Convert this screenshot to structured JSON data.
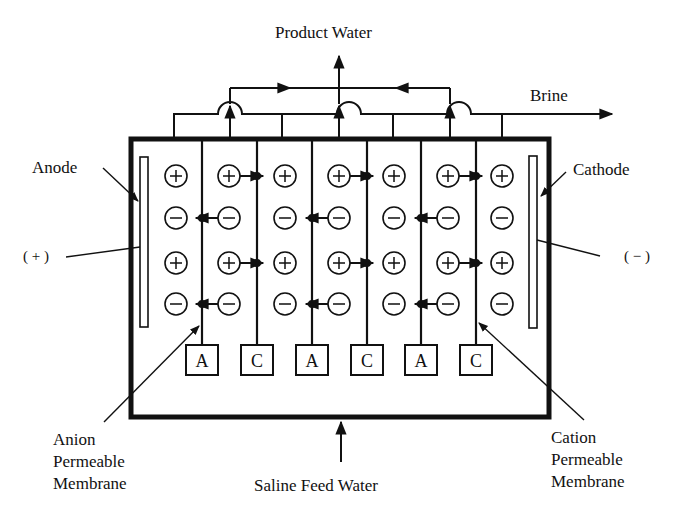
{
  "labels": {
    "product_water": "Product Water",
    "brine": "Brine",
    "anode": "Anode",
    "cathode": "Cathode",
    "anode_polarity": "( + )",
    "cathode_polarity": "( − )",
    "anion_membrane": [
      "Anion",
      "Permeable",
      "Membrane"
    ],
    "cation_membrane": [
      "Cation",
      "Permeable",
      "Membrane"
    ],
    "feed": "Saline Feed Water"
  },
  "membranes": [
    {
      "x": 202,
      "type": "A"
    },
    {
      "x": 257,
      "type": "C"
    },
    {
      "x": 312,
      "type": "A"
    },
    {
      "x": 367,
      "type": "C"
    },
    {
      "x": 421,
      "type": "A"
    },
    {
      "x": 476,
      "type": "C"
    }
  ],
  "ion_rows": [
    {
      "y": 176,
      "sign": "+"
    },
    {
      "y": 218,
      "sign": "-"
    },
    {
      "y": 263,
      "sign": "+"
    },
    {
      "y": 304,
      "sign": "-"
    }
  ],
  "ion_columns_x": [
    176,
    229,
    285,
    339,
    394,
    448,
    502
  ],
  "colors": {
    "ink": "#111111",
    "background": "#ffffff"
  }
}
